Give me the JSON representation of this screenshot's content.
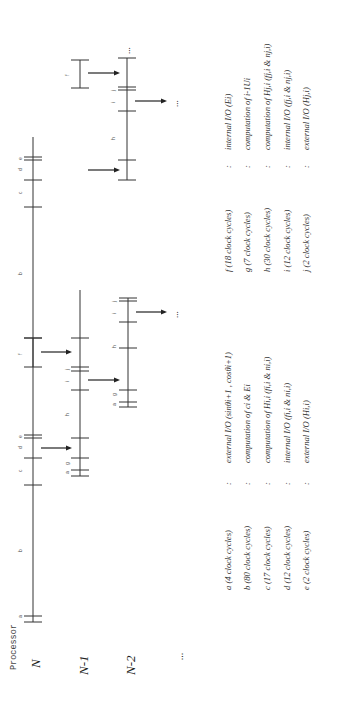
{
  "axis_title": "Processor",
  "processors": [
    {
      "label": "N"
    },
    {
      "label": "N-1"
    },
    {
      "label": "N-2"
    },
    {
      "label": "..."
    }
  ],
  "phase_labels": [
    "a",
    "b",
    "c",
    "d",
    "e",
    "f",
    "g",
    "h",
    "i",
    "j"
  ],
  "continuation": "...",
  "legend": {
    "left": [
      {
        "key": "a",
        "cycles": "a (4 clock cycles)",
        "sep": ":",
        "desc": "external I/O (sinθi+1 , cosθi+1)"
      },
      {
        "key": "b",
        "cycles": "b (80 clock cycles)",
        "sep": ":",
        "desc": "computation of ci & Ei"
      },
      {
        "key": "c",
        "cycles": "c (17 clock cycles)",
        "sep": ":",
        "desc": "computation of Hi,i (fi,i & ni,i)"
      },
      {
        "key": "d",
        "cycles": "d (12 clock cycles)",
        "sep": ":",
        "desc": "internal I/O (fi,i & ni,i)"
      },
      {
        "key": "e",
        "cycles": "e (2 clock cycles)",
        "sep": ":",
        "desc": "external I/O (Hi,i)"
      }
    ],
    "right": [
      {
        "key": "f",
        "cycles": "f (18 clock cycles)",
        "sep": ":",
        "desc": "internal I/O (Ei)"
      },
      {
        "key": "g",
        "cycles": "g (7 clock cycles)",
        "sep": ":",
        "desc": "computation of i-1Ui"
      },
      {
        "key": "h",
        "cycles": "h (30 clock cycles)",
        "sep": ":",
        "desc": "computation of Hj,i (fj,i & nj,i)"
      },
      {
        "key": "i",
        "cycles": "i (12 clock cycles)",
        "sep": ":",
        "desc": "internal I/O (fj,i & nj,i)"
      },
      {
        "key": "j",
        "cycles": "j (2 clock cycles)",
        "sep": ":",
        "desc": "external I/O (Hj,i)"
      }
    ]
  }
}
